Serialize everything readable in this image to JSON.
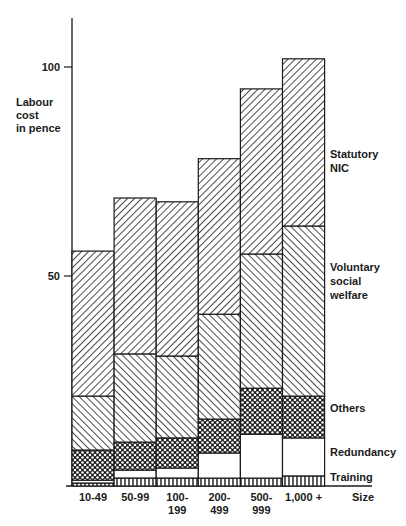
{
  "chart_data": {
    "type": "bar",
    "stacked": true,
    "title": "",
    "xlabel": "Size",
    "ylabel": "Labour cost in pence",
    "ylabel_lines": [
      "Labour",
      "cost",
      "in pence"
    ],
    "ylim": [
      0,
      115
    ],
    "yticks": [
      50,
      100
    ],
    "grid": false,
    "legend_position": "right (labels beside last bar)",
    "categories": [
      "10-49",
      "50-99",
      "100-199",
      "200-499",
      "500-999",
      "1,000+"
    ],
    "category_label_lines": [
      [
        "10-49"
      ],
      [
        "50-99"
      ],
      [
        "100-",
        "199"
      ],
      [
        "200-",
        "499"
      ],
      [
        "500-",
        "999"
      ],
      [
        "1,000 +"
      ]
    ],
    "series": [
      {
        "name": "Training",
        "pattern": "vertical-lines",
        "values": [
          0.7,
          1.9,
          1.9,
          1.9,
          1.9,
          2.4
        ]
      },
      {
        "name": "Redundancy",
        "pattern": "blank",
        "values": [
          0.7,
          1.9,
          2.4,
          6.0,
          10.5,
          9.1
        ]
      },
      {
        "name": "Others",
        "pattern": "crosshatch",
        "values": [
          7.2,
          6.7,
          7.2,
          8.1,
          11.0,
          10.0
        ]
      },
      {
        "name": "Voluntary social welfare",
        "pattern": "back-diagonal",
        "values": [
          12.9,
          21.1,
          19.6,
          25.1,
          32.1,
          40.7
        ]
      },
      {
        "name": "Statutory NIC",
        "pattern": "forward-diagonal",
        "values": [
          34.7,
          37.3,
          36.9,
          37.2,
          39.5,
          40.0
        ]
      }
    ],
    "totals": [
      56.2,
      68.9,
      68.0,
      78.3,
      95.0,
      102.2
    ]
  },
  "legend": {
    "statutory": [
      "Statutory",
      "NIC"
    ],
    "voluntary": [
      "Voluntary",
      "social",
      "welfare"
    ],
    "others": [
      "Others"
    ],
    "redundancy": [
      "Redundancy"
    ],
    "training": [
      "Training"
    ]
  },
  "axis": {
    "tick_50": "50",
    "tick_100": "100",
    "size_label": "Size"
  },
  "colors": {
    "ink": "#1a1a1a",
    "background": "#ffffff"
  }
}
